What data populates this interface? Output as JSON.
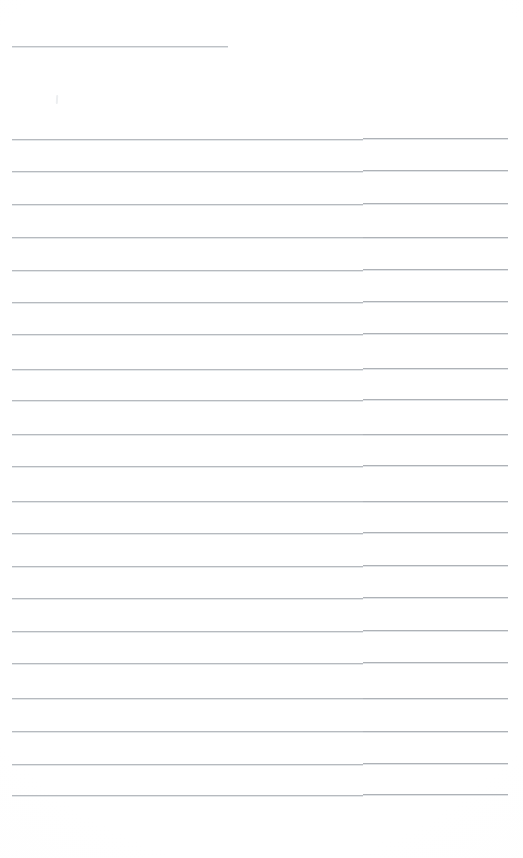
{
  "page": {
    "kind": "blank-ruled-notepad-scan",
    "width": 523,
    "height": 858,
    "background_color": "#fefefe",
    "written_content": "",
    "note": ""
  },
  "ink": {
    "rule_color": "#b6babf",
    "rule_color_right": "#aeb2b7",
    "rule_halo_color": "#e3e6e8",
    "header_rule_color": "#b9bdc2",
    "pencil_mark_color": "#eceef0"
  },
  "geometry": {
    "left_margin_x": 12,
    "right_margin_x": 508,
    "step_x": 363,
    "first_line_y": 139,
    "line_spacing": 32.4,
    "line_count": 21
  },
  "header_rule": {
    "label": "header-rule",
    "x": 12,
    "y": 46,
    "width": 216
  },
  "pencil_mark": {
    "label": "pencil-mark",
    "x": 56,
    "y": 95
  },
  "ruled_lines": [
    {
      "index": 1,
      "y": 139,
      "x_start": 12,
      "x_step": 363,
      "x_end": 508,
      "step_offset": -1
    },
    {
      "index": 2,
      "y": 171,
      "x_start": 12,
      "x_step": 363,
      "x_end": 508,
      "step_offset": -1
    },
    {
      "index": 3,
      "y": 204,
      "x_start": 12,
      "x_step": 363,
      "x_end": 508,
      "step_offset": -1
    },
    {
      "index": 4,
      "y": 237,
      "x_start": 12,
      "x_step": 363,
      "x_end": 508,
      "step_offset": 0
    },
    {
      "index": 5,
      "y": 270,
      "x_start": 12,
      "x_step": 363,
      "x_end": 508,
      "step_offset": -1
    },
    {
      "index": 6,
      "y": 302,
      "x_start": 12,
      "x_step": 363,
      "x_end": 508,
      "step_offset": -1
    },
    {
      "index": 7,
      "y": 334,
      "x_start": 12,
      "x_step": 363,
      "x_end": 508,
      "step_offset": -1
    },
    {
      "index": 8,
      "y": 369,
      "x_start": 12,
      "x_step": 363,
      "x_end": 508,
      "step_offset": -1
    },
    {
      "index": 9,
      "y": 400,
      "x_start": 12,
      "x_step": 363,
      "x_end": 508,
      "step_offset": -1
    },
    {
      "index": 10,
      "y": 434,
      "x_start": 12,
      "x_step": 363,
      "x_end": 508,
      "step_offset": 0
    },
    {
      "index": 11,
      "y": 466,
      "x_start": 12,
      "x_step": 363,
      "x_end": 508,
      "step_offset": -1
    },
    {
      "index": 12,
      "y": 501,
      "x_start": 12,
      "x_step": 363,
      "x_end": 508,
      "step_offset": 0
    },
    {
      "index": 13,
      "y": 533,
      "x_start": 12,
      "x_step": 363,
      "x_end": 508,
      "step_offset": -1
    },
    {
      "index": 14,
      "y": 566,
      "x_start": 12,
      "x_step": 363,
      "x_end": 508,
      "step_offset": -1
    },
    {
      "index": 15,
      "y": 598,
      "x_start": 12,
      "x_step": 363,
      "x_end": 508,
      "step_offset": -1
    },
    {
      "index": 16,
      "y": 631,
      "x_start": 12,
      "x_step": 363,
      "x_end": 508,
      "step_offset": -1
    },
    {
      "index": 17,
      "y": 663,
      "x_start": 12,
      "x_step": 363,
      "x_end": 508,
      "step_offset": -1
    },
    {
      "index": 18,
      "y": 698,
      "x_start": 12,
      "x_step": 363,
      "x_end": 508,
      "step_offset": 0
    },
    {
      "index": 19,
      "y": 731,
      "x_start": 12,
      "x_step": 363,
      "x_end": 508,
      "step_offset": 0
    },
    {
      "index": 20,
      "y": 764,
      "x_start": 12,
      "x_step": 363,
      "x_end": 508,
      "step_offset": -1
    },
    {
      "index": 21,
      "y": 795,
      "x_start": 12,
      "x_step": 363,
      "x_end": 508,
      "step_offset": -1
    }
  ]
}
